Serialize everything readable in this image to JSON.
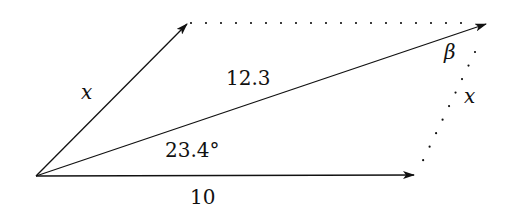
{
  "diagram": {
    "type": "vector-parallelogram",
    "labels": {
      "side_x_left": "x",
      "side_x_right": "x",
      "diagonal": "12.3",
      "angle": "23.4°",
      "base": "10",
      "beta": "β"
    },
    "colors": {
      "stroke": "#111111",
      "background": "#ffffff"
    }
  }
}
